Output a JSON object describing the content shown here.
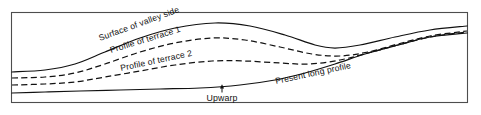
{
  "figure": {
    "background_color": "#ffffff",
    "line_color": "#111111",
    "frame_color": "#4d4d4d",
    "width": 481,
    "height": 115
  },
  "labels": {
    "valley_side": "Surface of valley side",
    "terrace_1": "Profile of terrace 1",
    "terrace_2": "Profile of terrace 2",
    "present_profile": "Present long profile",
    "upwarp": "Upwarp"
  },
  "chart_data": {
    "type": "line",
    "xlabel": "",
    "ylabel": "",
    "grid": false,
    "legend": "inline-curve-labels",
    "xlim": [
      11,
      468
    ],
    "ylim": [
      12,
      103
    ],
    "note": "y values are screen pixels: smaller y = higher elevation",
    "series": [
      {
        "name": "Surface of valley side",
        "style": "solid",
        "label": "Surface of valley side",
        "points": [
          [
            12,
            72
          ],
          [
            45,
            70
          ],
          [
            75,
            64
          ],
          [
            105,
            52
          ],
          [
            140,
            38
          ],
          [
            175,
            28
          ],
          [
            215,
            23
          ],
          [
            250,
            26
          ],
          [
            285,
            35
          ],
          [
            315,
            45
          ],
          [
            335,
            48
          ],
          [
            360,
            45
          ],
          [
            395,
            37
          ],
          [
            430,
            30
          ],
          [
            467,
            26
          ]
        ]
      },
      {
        "name": "Profile of terrace 1",
        "style": "dashed",
        "label": "Profile of terrace 1",
        "points": [
          [
            12,
            78
          ],
          [
            45,
            77
          ],
          [
            75,
            73
          ],
          [
            105,
            64
          ],
          [
            140,
            52
          ],
          [
            175,
            43
          ],
          [
            212,
            38
          ],
          [
            245,
            40
          ],
          [
            280,
            47
          ],
          [
            312,
            54
          ],
          [
            340,
            56
          ],
          [
            368,
            52
          ],
          [
            398,
            44
          ],
          [
            430,
            36
          ],
          [
            467,
            31
          ]
        ]
      },
      {
        "name": "Profile of terrace 2",
        "style": "dashed",
        "label": "Profile of terrace 2",
        "points": [
          [
            12,
            85
          ],
          [
            45,
            84
          ],
          [
            75,
            82
          ],
          [
            105,
            77
          ],
          [
            140,
            71
          ],
          [
            175,
            65
          ],
          [
            212,
            61
          ],
          [
            245,
            61
          ],
          [
            280,
            63
          ],
          [
            310,
            64
          ],
          [
            340,
            60
          ],
          [
            368,
            53
          ],
          [
            398,
            45
          ],
          [
            430,
            37
          ],
          [
            467,
            32
          ]
        ]
      },
      {
        "name": "Present long profile",
        "style": "solid",
        "label": "Present long profile",
        "points": [
          [
            12,
            93
          ],
          [
            45,
            92
          ],
          [
            80,
            91
          ],
          [
            120,
            90
          ],
          [
            160,
            89
          ],
          [
            200,
            88
          ],
          [
            240,
            85
          ],
          [
            275,
            80
          ],
          [
            305,
            73
          ],
          [
            335,
            64
          ],
          [
            365,
            54
          ],
          [
            398,
            45
          ],
          [
            430,
            37
          ],
          [
            467,
            33
          ]
        ]
      }
    ],
    "annotations": [
      {
        "text": "Upwarp",
        "type": "arrow-callout",
        "x": 222,
        "y": 98,
        "arrow_from": [
          222,
          93
        ],
        "arrow_to": [
          222,
          85
        ],
        "rotation": 0
      },
      {
        "text": "Surface of valley side",
        "type": "curve-label",
        "x": 100,
        "y": 41,
        "rotation": -20
      },
      {
        "text": "Profile of terrace 1",
        "type": "curve-label",
        "x": 111,
        "y": 53,
        "rotation": -17
      },
      {
        "text": "Profile of terrace 2",
        "type": "curve-label",
        "x": 121,
        "y": 71,
        "rotation": -12
      },
      {
        "text": "Present long profile",
        "type": "curve-label",
        "x": 276,
        "y": 84,
        "rotation": -12
      }
    ]
  }
}
